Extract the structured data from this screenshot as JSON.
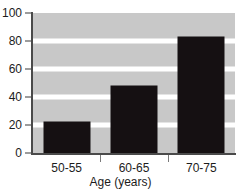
{
  "chart_data": {
    "type": "bar",
    "title": "",
    "subtitle": "",
    "categories": [
      "50-55",
      "60-65",
      "70-75"
    ],
    "values": [
      22,
      48,
      83
    ],
    "xlabel": "Age (years)",
    "ylabel": "",
    "ylim": [
      0,
      100
    ],
    "yticks": [
      0,
      20,
      40,
      60,
      80,
      100
    ],
    "ytick_labels": [
      "0",
      "20",
      "40",
      "60",
      "80",
      "100"
    ],
    "grid": "horizontal-white-bands",
    "legend": "none",
    "bar_color": "#151012",
    "plot_background": "#c8c8c8",
    "figure_background": "#ffffff",
    "axis_color": "#4a4a4a",
    "gridline_color": "#ffffff",
    "text_color": "#1c1c1c"
  },
  "axes": {
    "y": {
      "ticks": [
        {
          "label": "100",
          "value": 100
        },
        {
          "label": "80",
          "value": 80
        },
        {
          "label": "60",
          "value": 60
        },
        {
          "label": "40",
          "value": 40
        },
        {
          "label": "20",
          "value": 20
        },
        {
          "label": "0",
          "value": 0
        }
      ]
    },
    "x": {
      "title": "Age (years)",
      "ticks": [
        {
          "label": "50-55"
        },
        {
          "label": "60-65"
        },
        {
          "label": "70-75"
        }
      ]
    }
  },
  "caption": {
    "clipped_text": ""
  }
}
